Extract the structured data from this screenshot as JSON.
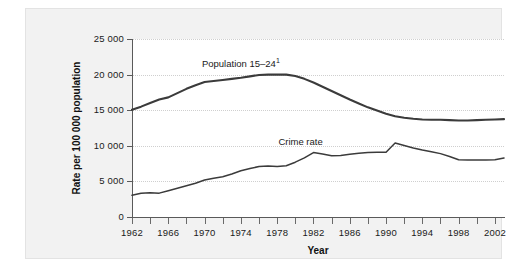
{
  "chart_data": {
    "type": "line",
    "title": "",
    "xlabel": "Year",
    "ylabel": "Rate per 100 000 population",
    "xlim": [
      1962,
      2003
    ],
    "ylim": [
      0,
      25000
    ],
    "grid": true,
    "legend_position": "inline-annotations",
    "ytick_labels": [
      "0",
      "5 000",
      "10 000",
      "15 000",
      "20 000",
      "25 000"
    ],
    "ytick_values": [
      0,
      5000,
      10000,
      15000,
      20000,
      25000
    ],
    "xtick_labels": [
      "1962",
      "1966",
      "1970",
      "1974",
      "1978",
      "1982",
      "1986",
      "1990",
      "1994",
      "1998",
      "2002"
    ],
    "xtick_values": [
      1962,
      1966,
      1970,
      1974,
      1978,
      1982,
      1986,
      1990,
      1994,
      1998,
      2002
    ],
    "xminor_values": [
      1964,
      1968,
      1972,
      1976,
      1980,
      1984,
      1988,
      1992,
      1996,
      2000
    ],
    "annotations": [
      {
        "text": "Population 15–24",
        "superscript": "1",
        "x": 1975,
        "y": 21600
      },
      {
        "text": "Crime rate",
        "x": 1981,
        "y": 10600
      }
    ],
    "x": [
      1962,
      1963,
      1964,
      1965,
      1966,
      1967,
      1968,
      1969,
      1970,
      1971,
      1972,
      1973,
      1974,
      1975,
      1976,
      1977,
      1978,
      1979,
      1980,
      1981,
      1982,
      1983,
      1984,
      1985,
      1986,
      1987,
      1988,
      1989,
      1990,
      1991,
      1992,
      1993,
      1994,
      1995,
      1996,
      1997,
      1998,
      1999,
      2000,
      2001,
      2002,
      2003
    ],
    "series": [
      {
        "name": "Population 15–24",
        "color": "#3b3b3b",
        "values": [
          15050,
          15500,
          16000,
          16500,
          16800,
          17400,
          18000,
          18500,
          18950,
          19100,
          19250,
          19400,
          19550,
          19750,
          19950,
          20000,
          20000,
          20000,
          19800,
          19400,
          18900,
          18300,
          17700,
          17100,
          16500,
          15950,
          15400,
          14950,
          14500,
          14150,
          13950,
          13800,
          13700,
          13650,
          13650,
          13600,
          13550,
          13550,
          13600,
          13650,
          13700,
          13750
        ]
      },
      {
        "name": "Crime rate",
        "color": "#3b3b3b",
        "values": [
          3050,
          3350,
          3400,
          3350,
          3700,
          4050,
          4400,
          4750,
          5200,
          5450,
          5650,
          6050,
          6500,
          6800,
          7100,
          7150,
          7100,
          7200,
          7700,
          8300,
          9050,
          8850,
          8600,
          8650,
          8800,
          8950,
          9050,
          9100,
          9100,
          10400,
          10050,
          9700,
          9400,
          9150,
          8900,
          8500,
          8050,
          8000,
          8000,
          8000,
          8050,
          8300
        ]
      }
    ]
  },
  "footnote_marker": "1"
}
